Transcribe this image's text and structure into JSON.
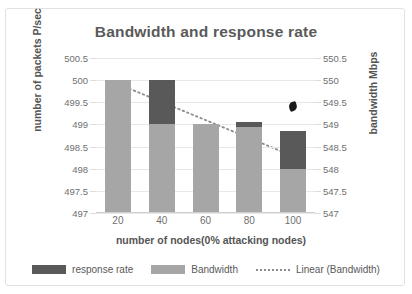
{
  "chart_data": {
    "type": "bar",
    "title": "Bandwidth and response rate",
    "xlabel": "number of nodes(0% attacking nodes)",
    "ylabel": "number of packets P/sec",
    "ylabel_secondary": "bandwidth Mbps",
    "categories": [
      "20",
      "40",
      "60",
      "80",
      "100"
    ],
    "ylim": [
      497,
      500.5
    ],
    "ylim_secondary": [
      547,
      550.5
    ],
    "ytick_step": 0.5,
    "yticks": [
      "497",
      "497.5",
      "498",
      "498.5",
      "499",
      "499.5",
      "500",
      "500.5"
    ],
    "yticks_secondary": [
      "547",
      "547.5",
      "548",
      "548.5",
      "549",
      "549.5",
      "550",
      "550.5"
    ],
    "grid": true,
    "stacked": true,
    "legend_position": "bottom",
    "series": [
      {
        "name": "Bandwidth",
        "color": "#a6a6a6",
        "values": [
          500,
          499,
          499,
          498.95,
          498
        ]
      },
      {
        "name": "response rate",
        "color": "#595959",
        "values": [
          500,
          500,
          499,
          499.05,
          498.85
        ]
      }
    ],
    "trendline": {
      "name": "Linear (Bandwidth)",
      "style": "dotted",
      "color": "#8c8c8c",
      "start_value": 499.85,
      "end_value": 498.2
    }
  },
  "legend": {
    "items": [
      {
        "label": "response rate"
      },
      {
        "label": "Bandwidth"
      },
      {
        "label": "Linear (Bandwidth)"
      }
    ]
  }
}
